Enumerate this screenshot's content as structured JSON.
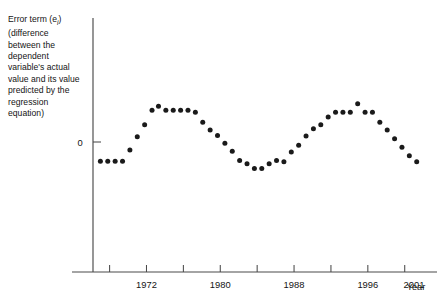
{
  "caption": {
    "line1_pre": "Error term (e",
    "line1_sub": "i",
    "line1_post": ")",
    "rest": "(difference between the dependent variable's actual value and its value predicted by the regression equation)"
  },
  "axes": {
    "y_zero_label": "0",
    "x_axis_title": "Year",
    "x_tick_labels": [
      "1972",
      "1980",
      "1988",
      "1996",
      "2001"
    ],
    "x_tick_label_years": [
      1972,
      1980,
      1988,
      1996,
      2001
    ],
    "x_tick_years_all": [
      1968,
      1972,
      1976,
      1980,
      1984,
      1988,
      1992,
      1996,
      2000
    ],
    "colors": {
      "axis": "#4a4a4a",
      "point": "#1a1a1a",
      "text": "#141414",
      "background": "#ffffff"
    }
  },
  "chart_data": {
    "type": "scatter",
    "title": "",
    "subtitle": "",
    "xlabel": "Year",
    "ylabel": "Error term (e_i)",
    "grid": false,
    "legend": "none",
    "xlim": [
      1966.2,
      2003.5
    ],
    "ylim": [
      -1.35,
      1.35
    ],
    "y_ticks": [
      0
    ],
    "y_tick_labels": [
      "0"
    ],
    "x_ticks": [
      1968,
      1972,
      1976,
      1980,
      1984,
      1988,
      1992,
      1996,
      2000
    ],
    "x_tick_labels_shown": [
      "1972",
      "1980",
      "1988",
      "1996",
      "2001"
    ],
    "annotations": [],
    "series": [
      {
        "name": "Residuals",
        "marker": "circle",
        "color": "#1a1a1a",
        "x": [
          1967.0,
          1967.8,
          1968.6,
          1969.4,
          1970.2,
          1971.0,
          1971.8,
          1972.6,
          1973.3,
          1974.1,
          1974.9,
          1975.7,
          1976.5,
          1977.3,
          1978.1,
          1978.9,
          1979.7,
          1980.5,
          1981.3,
          1982.1,
          1982.9,
          1983.7,
          1984.5,
          1985.3,
          1986.1,
          1986.9,
          1987.7,
          1988.5,
          1989.3,
          1990.1,
          1990.9,
          1991.7,
          1992.5,
          1993.3,
          1994.1,
          1994.9,
          1995.7,
          1996.5,
          1997.3,
          1998.1,
          1998.9,
          1999.7,
          2000.5,
          2001.3
        ],
        "y": [
          -0.29,
          -0.29,
          -0.29,
          -0.29,
          -0.12,
          0.08,
          0.26,
          0.48,
          0.54,
          0.48,
          0.48,
          0.48,
          0.48,
          0.45,
          0.3,
          0.18,
          0.1,
          -0.02,
          -0.14,
          -0.28,
          -0.33,
          -0.4,
          -0.4,
          -0.33,
          -0.28,
          -0.3,
          -0.15,
          -0.05,
          0.09,
          0.2,
          0.26,
          0.38,
          0.45,
          0.45,
          0.45,
          0.58,
          0.45,
          0.45,
          0.3,
          0.18,
          0.05,
          -0.08,
          -0.21,
          -0.3
        ]
      }
    ]
  }
}
